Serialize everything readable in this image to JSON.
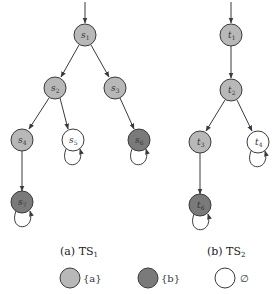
{
  "colors": {
    "a": "#b8b8b8",
    "b": "#7a7a7a",
    "empty": "#ffffff",
    "stroke": "#3a3a3a"
  },
  "ts1": {
    "caption": "(a) TS",
    "caption_sub": "1",
    "nodes": [
      {
        "id": "s1",
        "base": "s",
        "sub": "1",
        "label_type": "a"
      },
      {
        "id": "s2",
        "base": "s",
        "sub": "2",
        "label_type": "a"
      },
      {
        "id": "s3",
        "base": "s",
        "sub": "3",
        "label_type": "a"
      },
      {
        "id": "s4",
        "base": "s",
        "sub": "4",
        "label_type": "a"
      },
      {
        "id": "s5",
        "base": "s",
        "sub": "5",
        "label_type": "empty"
      },
      {
        "id": "s6",
        "base": "s",
        "sub": "6",
        "label_type": "b"
      },
      {
        "id": "s7",
        "base": "s",
        "sub": "7",
        "label_type": "b"
      }
    ],
    "edges": [
      [
        "init",
        "s1"
      ],
      [
        "s1",
        "s2"
      ],
      [
        "s1",
        "s3"
      ],
      [
        "s2",
        "s4"
      ],
      [
        "s2",
        "s5"
      ],
      [
        "s3",
        "s6"
      ],
      [
        "s4",
        "s7"
      ],
      [
        "s5",
        "s5"
      ],
      [
        "s6",
        "s6"
      ],
      [
        "s7",
        "s7"
      ]
    ]
  },
  "ts2": {
    "caption": "(b) TS",
    "caption_sub": "2",
    "nodes": [
      {
        "id": "t1",
        "base": "t",
        "sub": "1",
        "label_type": "a"
      },
      {
        "id": "t2",
        "base": "t",
        "sub": "2",
        "label_type": "a"
      },
      {
        "id": "t3",
        "base": "t",
        "sub": "3",
        "label_type": "a"
      },
      {
        "id": "t4",
        "base": "t",
        "sub": "4",
        "label_type": "empty"
      },
      {
        "id": "t6",
        "base": "t",
        "sub": "6",
        "label_type": "b"
      }
    ],
    "edges": [
      [
        "init",
        "t1"
      ],
      [
        "t1",
        "t2"
      ],
      [
        "t2",
        "t3"
      ],
      [
        "t2",
        "t4"
      ],
      [
        "t3",
        "t6"
      ],
      [
        "t4",
        "t4"
      ],
      [
        "t6",
        "t6"
      ]
    ]
  },
  "legend": [
    {
      "type": "a",
      "text": "{a}"
    },
    {
      "type": "b",
      "text": "{b}"
    },
    {
      "type": "empty",
      "text": "∅"
    }
  ]
}
